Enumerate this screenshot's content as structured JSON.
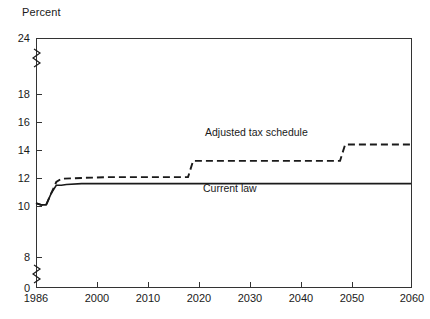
{
  "chart_data": {
    "type": "line",
    "title": "",
    "ylabel": "Percent",
    "xlabel": "",
    "xlim": [
      1986,
      2060
    ],
    "ylim": [
      0,
      24
    ],
    "grid": false,
    "legend_position": "inline-annotations",
    "y_ticks": [
      0,
      8,
      10,
      12,
      14,
      16,
      18,
      24
    ],
    "y_tick_labels": [
      "0",
      "8",
      "10",
      "12",
      "14",
      "16",
      "18",
      "24"
    ],
    "y_axis_breaks": [
      [
        0,
        8
      ],
      [
        18,
        24
      ]
    ],
    "x_ticks": [
      1986,
      2000,
      2010,
      2020,
      2030,
      2040,
      2050,
      2060
    ],
    "x_tick_labels": [
      "1986",
      "2000",
      "2010",
      "2020",
      "2030",
      "2040",
      "2050",
      "2060"
    ],
    "series": [
      {
        "name": "Current law",
        "style": "solid",
        "color": "#1a1a1a",
        "x": [
          1986,
          1987,
          1988,
          1989,
          1990,
          1991,
          1992,
          1995,
          2000,
          2010,
          2020,
          2030,
          2040,
          2050,
          2060
        ],
        "values": [
          11.3,
          11.2,
          11.2,
          11.9,
          12.4,
          12.4,
          12.45,
          12.5,
          12.5,
          12.5,
          12.5,
          12.5,
          12.5,
          12.5,
          12.5
        ]
      },
      {
        "name": "Adjusted tax schedule",
        "style": "dashed",
        "color": "#1a1a1a",
        "x": [
          1986,
          1987,
          1988,
          1989,
          1990,
          1991,
          1995,
          2000,
          2010,
          2016,
          2017,
          2020,
          2030,
          2040,
          2046,
          2047,
          2050,
          2060
        ],
        "values": [
          11.3,
          11.2,
          11.2,
          11.9,
          12.6,
          12.8,
          12.85,
          12.9,
          12.9,
          12.9,
          13.9,
          13.9,
          13.9,
          13.9,
          13.9,
          14.9,
          14.9,
          14.9
        ]
      }
    ],
    "annotations": [
      {
        "text": "Adjusted tax schedule",
        "x": 2019,
        "y": 14.5
      },
      {
        "text": "Current law",
        "x": 2026,
        "y": 12.0
      }
    ]
  }
}
